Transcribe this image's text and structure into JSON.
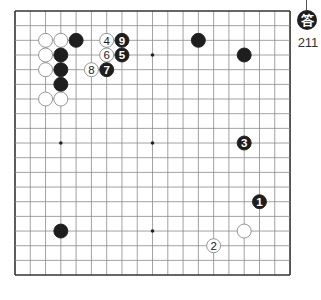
{
  "badge": {
    "label": "答",
    "problem_number": "211"
  },
  "board": {
    "columns": 19,
    "rows": 19,
    "origin_x": 15,
    "origin_y": 11,
    "spacing_x": 15.28,
    "spacing_y": 14.67,
    "stone_radius": 7,
    "colors": {
      "line": "#8a8a8a",
      "edge": "#333333",
      "black": "#1e1e1e",
      "white": "#ffffff",
      "star": "#222222"
    },
    "star_points": [
      {
        "col": 3,
        "row": 3
      },
      {
        "col": 9,
        "row": 3
      },
      {
        "col": 15,
        "row": 3
      },
      {
        "col": 3,
        "row": 9
      },
      {
        "col": 9,
        "row": 9
      },
      {
        "col": 15,
        "row": 9
      },
      {
        "col": 3,
        "row": 15
      },
      {
        "col": 9,
        "row": 15
      },
      {
        "col": 15,
        "row": 15
      }
    ],
    "stones": [
      {
        "color": "white",
        "col": 2,
        "row": 2,
        "label": ""
      },
      {
        "color": "white",
        "col": 3,
        "row": 2,
        "label": ""
      },
      {
        "color": "black",
        "col": 4,
        "row": 2,
        "label": ""
      },
      {
        "color": "white",
        "col": 6,
        "row": 2,
        "label": "4"
      },
      {
        "color": "black",
        "col": 7,
        "row": 2,
        "label": "9"
      },
      {
        "color": "black",
        "col": 12,
        "row": 2,
        "label": ""
      },
      {
        "color": "white",
        "col": 2,
        "row": 3,
        "label": ""
      },
      {
        "color": "black",
        "col": 3,
        "row": 3,
        "label": ""
      },
      {
        "color": "white",
        "col": 6,
        "row": 3,
        "label": "6"
      },
      {
        "color": "black",
        "col": 7,
        "row": 3,
        "label": "5"
      },
      {
        "color": "black",
        "col": 15,
        "row": 3,
        "label": ""
      },
      {
        "color": "white",
        "col": 2,
        "row": 4,
        "label": ""
      },
      {
        "color": "black",
        "col": 3,
        "row": 4,
        "label": ""
      },
      {
        "color": "white",
        "col": 5,
        "row": 4,
        "label": "8"
      },
      {
        "color": "black",
        "col": 6,
        "row": 4,
        "label": "7"
      },
      {
        "color": "black",
        "col": 3,
        "row": 5,
        "label": ""
      },
      {
        "color": "white",
        "col": 2,
        "row": 6,
        "label": ""
      },
      {
        "color": "white",
        "col": 3,
        "row": 6,
        "label": ""
      },
      {
        "color": "black",
        "col": 15,
        "row": 9,
        "label": "3"
      },
      {
        "color": "black",
        "col": 16,
        "row": 13,
        "label": "1"
      },
      {
        "color": "black",
        "col": 3,
        "row": 15,
        "label": ""
      },
      {
        "color": "white",
        "col": 15,
        "row": 15,
        "label": ""
      },
      {
        "color": "white",
        "col": 13,
        "row": 16,
        "label": "2"
      }
    ]
  }
}
